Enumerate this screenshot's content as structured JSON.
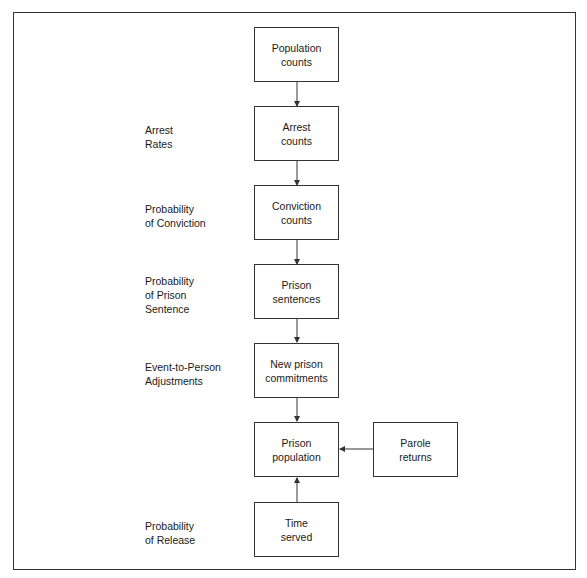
{
  "diagram": {
    "boxes": {
      "population_counts": "Population\ncounts",
      "arrest_counts": "Arrest\ncounts",
      "conviction_counts": "Conviction\ncounts",
      "prison_sentences": "Prison\nsentences",
      "new_prison_commitments": "New prison\ncommitments",
      "prison_population": "Prison\npopulation",
      "parole_returns": "Parole\nreturns",
      "time_served": "Time\nserved"
    },
    "labels": {
      "arrest_rates": "Arrest\nRates",
      "probability_of_conviction": "Probability\nof Conviction",
      "probability_of_prison_sentence": "Probability\nof Prison\nSentence",
      "event_to_person_adjustments": "Event-to-Person\nAdjustments",
      "probability_of_release": "Probability\nof Release"
    },
    "edges": [
      {
        "from": "Population counts",
        "to": "Arrest counts"
      },
      {
        "from": "Arrest counts",
        "to": "Conviction counts"
      },
      {
        "from": "Conviction counts",
        "to": "Prison sentences"
      },
      {
        "from": "Prison sentences",
        "to": "New prison commitments"
      },
      {
        "from": "New prison commitments",
        "to": "Prison population"
      },
      {
        "from": "Parole returns",
        "to": "Prison population"
      },
      {
        "from": "Time served",
        "to": "Prison population"
      }
    ]
  }
}
